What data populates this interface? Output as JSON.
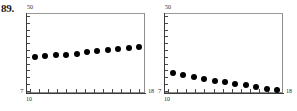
{
  "figure": {
    "problem_number": "89."
  },
  "chart_data": [
    {
      "type": "scatter",
      "name": "left-panel",
      "title": "",
      "xlabel": "",
      "ylabel": "",
      "xlim": [
        10,
        18
      ],
      "ylim": [
        7,
        50
      ],
      "xticklabels": {
        "min": "10",
        "max": "18"
      },
      "yticklabels": {
        "min": "7",
        "max": "50"
      },
      "grid": false,
      "legend": false,
      "x": [
        10.6,
        11.3,
        12.0,
        12.7,
        13.4,
        14.1,
        14.8,
        15.5,
        16.2,
        16.9,
        17.6
      ],
      "y": [
        26.5,
        26.8,
        27.2,
        27.6,
        28.2,
        28.8,
        29.4,
        30.0,
        30.8,
        31.4,
        31.8
      ]
    },
    {
      "type": "scatter",
      "name": "right-panel",
      "title": "",
      "xlabel": "",
      "ylabel": "",
      "xlim": [
        10,
        18
      ],
      "ylim": [
        7,
        50
      ],
      "xticklabels": {
        "min": "10",
        "max": "18"
      },
      "yticklabels": {
        "min": "7",
        "max": "50"
      },
      "grid": false,
      "legend": false,
      "x": [
        10.6,
        11.3,
        12.0,
        12.7,
        13.4,
        14.1,
        14.8,
        15.5,
        16.2,
        16.9,
        17.6
      ],
      "y": [
        17.6,
        16.6,
        15.7,
        14.6,
        13.7,
        12.8,
        12.0,
        11.2,
        10.2,
        9.2,
        8.4
      ]
    }
  ]
}
